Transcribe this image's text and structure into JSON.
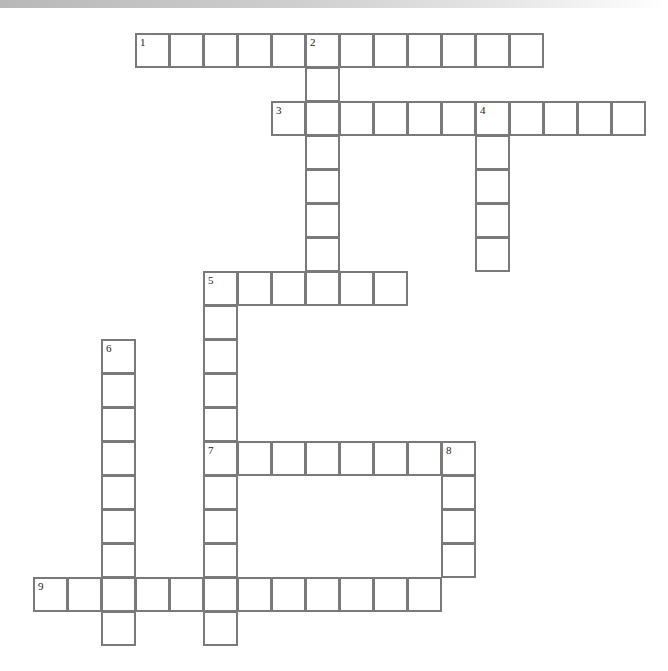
{
  "puzzle": {
    "type": "crossword",
    "cell_size": 34,
    "origin": {
      "x": 33,
      "y": 33
    },
    "line_color": "#7a7a7a",
    "entries": [
      {
        "number": "1",
        "direction": "across",
        "row": 0,
        "col": 3,
        "length": 12
      },
      {
        "number": "2",
        "direction": "down",
        "row": 0,
        "col": 8,
        "length": 8
      },
      {
        "number": "3",
        "direction": "across",
        "row": 2,
        "col": 7,
        "length": 11
      },
      {
        "number": "4",
        "direction": "down",
        "row": 2,
        "col": 13,
        "length": 5
      },
      {
        "number": "5",
        "direction": "across",
        "row": 7,
        "col": 5,
        "length": 6
      },
      {
        "number": "5",
        "direction": "down",
        "row": 7,
        "col": 5,
        "length": 11
      },
      {
        "number": "6",
        "direction": "down",
        "row": 9,
        "col": 2,
        "length": 9
      },
      {
        "number": "7",
        "direction": "across",
        "row": 12,
        "col": 5,
        "length": 8
      },
      {
        "number": "8",
        "direction": "down",
        "row": 12,
        "col": 12,
        "length": 4
      },
      {
        "number": "9",
        "direction": "across",
        "row": 16,
        "col": 0,
        "length": 12
      }
    ]
  }
}
